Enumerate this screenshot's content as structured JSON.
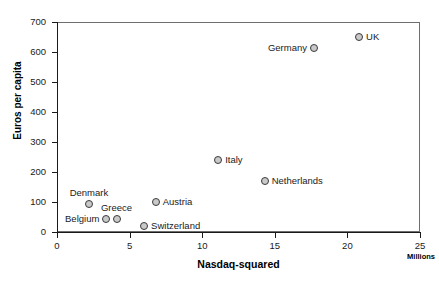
{
  "chart_data": {
    "type": "scatter",
    "title": "",
    "xlabel": "Nasdaq-squared",
    "ylabel": "Euros per capita",
    "units_note": "Millions",
    "xlim": [
      0,
      25
    ],
    "ylim": [
      0,
      700
    ],
    "xticks": [
      "0",
      "5",
      "10",
      "15",
      "20",
      "25"
    ],
    "yticks": [
      "0",
      "100",
      "200",
      "300",
      "400",
      "500",
      "600",
      "700"
    ],
    "grid": false,
    "legend": "none",
    "marker_style": "open-circle",
    "points": [
      {
        "label": "Denmark",
        "x": 2.2,
        "y": 95,
        "label_pos": "above"
      },
      {
        "label": "Belgium",
        "x": 3.4,
        "y": 45,
        "label_pos": "left"
      },
      {
        "label": "Greece",
        "x": 4.1,
        "y": 45,
        "label_pos": "above"
      },
      {
        "label": "Switzerland",
        "x": 6.0,
        "y": 20,
        "label_pos": "right"
      },
      {
        "label": "Austria",
        "x": 6.8,
        "y": 100,
        "label_pos": "right"
      },
      {
        "label": "Italy",
        "x": 11.1,
        "y": 240,
        "label_pos": "right"
      },
      {
        "label": "Netherlands",
        "x": 14.3,
        "y": 170,
        "label_pos": "right"
      },
      {
        "label": "Germany",
        "x": 17.7,
        "y": 615,
        "label_pos": "left"
      },
      {
        "label": "UK",
        "x": 20.8,
        "y": 650,
        "label_pos": "right"
      }
    ]
  }
}
